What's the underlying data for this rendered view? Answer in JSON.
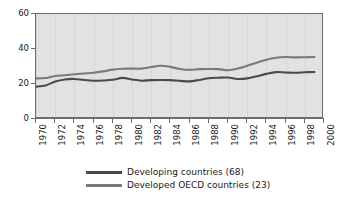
{
  "chart_data": {
    "type": "line",
    "title": "",
    "subtitle": "",
    "xlabel": "",
    "ylabel": "",
    "xlim": [
      1970,
      2000
    ],
    "ylim": [
      0,
      60
    ],
    "yticks": [
      0,
      20,
      40,
      60
    ],
    "xticks": [
      1970,
      1972,
      1974,
      1976,
      1978,
      1980,
      1982,
      1984,
      1986,
      1988,
      1990,
      1992,
      1994,
      1996,
      1998,
      2000
    ],
    "xtick_labels": [
      "1970",
      "1972",
      "1974",
      "1976",
      "1978",
      "1980",
      "1982",
      "1984",
      "1986",
      "1988",
      "1990",
      "1992",
      "1994",
      "1996",
      "1998",
      "2000"
    ],
    "ytick_labels": [
      "0",
      "20",
      "40",
      "60"
    ],
    "grid": "vertical-faint",
    "legend_position": "below",
    "plot_background": "#e2e2e2",
    "x": [
      1970,
      1971,
      1972,
      1973,
      1974,
      1975,
      1976,
      1977,
      1978,
      1979,
      1980,
      1981,
      1982,
      1983,
      1984,
      1985,
      1986,
      1987,
      1988,
      1989,
      1990,
      1991,
      1992,
      1993,
      1994,
      1995,
      1996,
      1997,
      1998,
      1999
    ],
    "series": [
      {
        "name": "Developing countries (68)",
        "color": "#4a4a4a",
        "values": [
          18.5,
          19.2,
          21.4,
          22.6,
          22.9,
          22.3,
          21.9,
          22.0,
          22.4,
          23.5,
          22.6,
          21.9,
          22.2,
          22.3,
          22.2,
          21.8,
          21.5,
          22.3,
          23.3,
          23.6,
          23.7,
          22.9,
          23.2,
          24.4,
          25.8,
          26.8,
          26.6,
          26.4,
          26.7,
          26.9
        ]
      },
      {
        "name": "Developed OECD countries (23)",
        "color": "#7a7a7a",
        "values": [
          23.2,
          23.4,
          24.6,
          25.0,
          25.6,
          26.0,
          26.4,
          27.2,
          28.2,
          28.7,
          28.8,
          28.8,
          29.7,
          30.4,
          29.8,
          28.6,
          28.1,
          28.5,
          28.6,
          28.5,
          27.9,
          28.8,
          30.4,
          32.2,
          33.9,
          35.0,
          35.4,
          35.2,
          35.3,
          35.4
        ]
      }
    ]
  },
  "legend": {
    "items": [
      {
        "label": "Developing countries (68)",
        "color": "#4a4a4a"
      },
      {
        "label": "Developed OECD countries (23)",
        "color": "#7a7a7a"
      }
    ]
  }
}
